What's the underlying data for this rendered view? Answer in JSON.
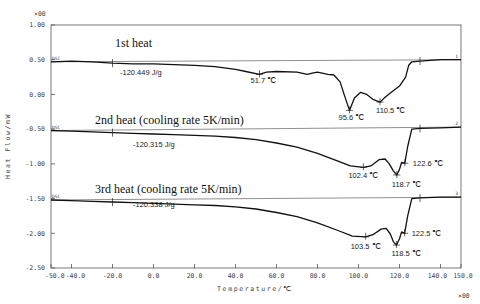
{
  "chart_data": {
    "type": "line",
    "title": "",
    "xlabel": "Temperature/℃",
    "ylabel": "Heat Flow/mW",
    "xlim": [
      -50,
      150
    ],
    "ylim": [
      -2.5,
      1.0
    ],
    "x_scale_note": "×10^0",
    "y_scale_note": "×10^0",
    "x_multiplier_label": "×00",
    "y_multiplier_label": "×00",
    "xticks": [
      "-50.0",
      "-40.0",
      "-20.0",
      "0.0",
      "20.0",
      "40.0",
      "60.0",
      "80.0",
      "100.0",
      "120.0",
      "140.0",
      "150.0"
    ],
    "xtick_values": [
      -50,
      -40,
      -20,
      0,
      20,
      40,
      60,
      80,
      100,
      120,
      140,
      150
    ],
    "yticks": [
      "1.00",
      "0.50",
      "0.00",
      "-0.50",
      "-1.00",
      "-1.50",
      "-2.00",
      "-2.50"
    ],
    "ytick_values": [
      1.0,
      0.5,
      0.0,
      -0.5,
      -1.0,
      -1.5,
      -2.0,
      -2.5
    ],
    "grid": false,
    "legend": "none",
    "series": [
      {
        "name": "1st heat",
        "curve_number": "1",
        "start_label": "DSC",
        "enthalpy": "-120.449 J/g",
        "peaks": [
          {
            "label": "51.7 ℃",
            "x": 51.7,
            "y": 0.29
          },
          {
            "label": "95.6 ℃",
            "x": 95.6,
            "y": -0.23
          },
          {
            "label": "110.5 ℃",
            "x": 110.5,
            "y": -0.11
          }
        ],
        "baseline_points": [
          [
            -50,
            0.47
          ],
          [
            150,
            0.5
          ]
        ],
        "x": [
          -50,
          -40,
          -30,
          -20,
          -10,
          0,
          10,
          20,
          30,
          40,
          45,
          51.7,
          55,
          60,
          70,
          75,
          78,
          80,
          85,
          88,
          91,
          93,
          95.6,
          98,
          101,
          104,
          107,
          110.5,
          113,
          116,
          120,
          123,
          124.5,
          126,
          130,
          140,
          150
        ],
        "values": [
          0.47,
          0.48,
          0.47,
          0.45,
          0.44,
          0.44,
          0.43,
          0.42,
          0.4,
          0.36,
          0.33,
          0.29,
          0.32,
          0.33,
          0.32,
          0.29,
          0.31,
          0.32,
          0.29,
          0.28,
          0.18,
          0.0,
          -0.23,
          -0.05,
          0.03,
          0.0,
          -0.07,
          -0.11,
          -0.04,
          0.03,
          0.12,
          0.25,
          0.42,
          0.47,
          0.48,
          0.5,
          0.5
        ]
      },
      {
        "name": "2nd heat (cooling rate 5K/min)",
        "curve_number": "2",
        "start_label": "DSC",
        "enthalpy": "-120.315 J/g",
        "peaks": [
          {
            "label": "102.4 ℃",
            "x": 102.4,
            "y": -1.05
          },
          {
            "label": "118.7 ℃",
            "x": 118.7,
            "y": -1.16
          },
          {
            "label": "122.6 ℃",
            "x": 122.6,
            "y": -0.99
          }
        ],
        "baseline_points": [
          [
            -50,
            -0.52
          ],
          [
            150,
            -0.47
          ]
        ],
        "x": [
          -50,
          -40,
          -30,
          -20,
          -10,
          0,
          10,
          20,
          30,
          40,
          50,
          60,
          70,
          80,
          90,
          96,
          102.4,
          106,
          110,
          113,
          115,
          117,
          118.7,
          120,
          121,
          122.6,
          124,
          126,
          130,
          140,
          150
        ],
        "values": [
          -0.52,
          -0.53,
          -0.54,
          -0.55,
          -0.56,
          -0.57,
          -0.58,
          -0.59,
          -0.6,
          -0.62,
          -0.65,
          -0.7,
          -0.76,
          -0.85,
          -0.96,
          -1.03,
          -1.05,
          -1.03,
          -0.94,
          -0.93,
          -1.0,
          -1.1,
          -1.16,
          -1.08,
          -0.98,
          -0.99,
          -0.75,
          -0.5,
          -0.49,
          -0.48,
          -0.47
        ]
      },
      {
        "name": "3rd heat (cooling rate 5K/min)",
        "curve_number": "3",
        "start_label": "DSC",
        "enthalpy": "-120.338 J/g",
        "peaks": [
          {
            "label": "103.5 ℃",
            "x": 103.5,
            "y": -2.05
          },
          {
            "label": "118.5 ℃",
            "x": 118.5,
            "y": -2.17
          },
          {
            "label": "122.5 ℃",
            "x": 122.5,
            "y": -2.0
          }
        ],
        "baseline_points": [
          [
            -50,
            -1.52
          ],
          [
            150,
            -1.48
          ]
        ],
        "x": [
          -50,
          -40,
          -30,
          -20,
          -10,
          0,
          10,
          20,
          30,
          40,
          50,
          60,
          70,
          80,
          90,
          97,
          103.5,
          107,
          111,
          113.5,
          115.5,
          117,
          118.5,
          120,
          121,
          122.5,
          124,
          126,
          130,
          140,
          150
        ],
        "values": [
          -1.52,
          -1.53,
          -1.54,
          -1.55,
          -1.56,
          -1.57,
          -1.58,
          -1.59,
          -1.6,
          -1.62,
          -1.65,
          -1.7,
          -1.76,
          -1.85,
          -1.96,
          -2.04,
          -2.05,
          -2.02,
          -1.94,
          -1.93,
          -2.01,
          -2.12,
          -2.17,
          -2.08,
          -1.98,
          -2.0,
          -1.75,
          -1.5,
          -1.49,
          -1.48,
          -1.48
        ]
      }
    ]
  }
}
